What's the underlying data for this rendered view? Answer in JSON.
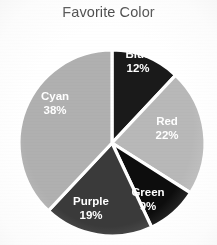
{
  "chart_data": {
    "type": "pie",
    "title": "Favorite Color",
    "xlabel": "",
    "ylabel": "",
    "grid": false,
    "legend_position": "none",
    "labels_inside_slices": true,
    "value_unit": "%",
    "categories": [
      "Blue",
      "Red",
      "Green",
      "Purple",
      "Cyan"
    ],
    "values": [
      12,
      22,
      9,
      19,
      38
    ],
    "total": 100,
    "start_angle_deg": 0,
    "direction": "clockwise",
    "slices": [
      {
        "name": "Blue",
        "label": "Blue",
        "value": 12,
        "value_label": "12%",
        "color": "#1a1a1a",
        "start_angle_deg": 0,
        "end_angle_deg": 43.2,
        "label_x": 138,
        "label_y": 55,
        "text_color": "#ffffff"
      },
      {
        "name": "Red",
        "label": "Red",
        "value": 22,
        "value_label": "22%",
        "color": "#b8b8b8",
        "start_angle_deg": 43.2,
        "end_angle_deg": 122.4,
        "label_x": 167,
        "label_y": 122,
        "text_color": "#ffffff"
      },
      {
        "name": "Green",
        "label": "Green",
        "value": 9,
        "value_label": "9%",
        "color": "#0d0d0d",
        "start_angle_deg": 122.4,
        "end_angle_deg": 154.8,
        "label_x": 148,
        "label_y": 193,
        "text_color": "#ffffff"
      },
      {
        "name": "Purple",
        "label": "Purple",
        "value": 19,
        "value_label": "19%",
        "color": "#3a3a3a",
        "start_angle_deg": 154.8,
        "end_angle_deg": 223.2,
        "label_x": 91,
        "label_y": 202,
        "text_color": "#ffffff"
      },
      {
        "name": "Cyan",
        "label": "Cyan",
        "value": 38,
        "value_label": "38%",
        "color": "#b0b0b0",
        "start_angle_deg": 223.2,
        "end_angle_deg": 360,
        "label_x": 55,
        "label_y": 97,
        "text_color": "#ffffff"
      }
    ],
    "geometry": {
      "center_x": 112,
      "center_y": 143,
      "radius": 93,
      "gap_color": "#ffffff"
    },
    "colors": {
      "background": "#ffffff",
      "title_text": "#3b3b3b",
      "slice_border": "#ffffff"
    }
  }
}
